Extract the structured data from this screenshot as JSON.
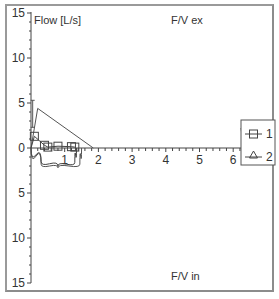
{
  "chart_data": {
    "type": "line",
    "title_top": "F/V ex",
    "title_bottom": "F/V in",
    "ylabel": "Flow [L/s]",
    "xlabel": "",
    "xlim": [
      0,
      6.8
    ],
    "ylim_top": [
      0,
      15
    ],
    "ylim_bottom": [
      0,
      15
    ],
    "x_ticks": [
      "1",
      "2",
      "3",
      "4",
      "5",
      "6"
    ],
    "y_ticks_top": [
      "15",
      "10",
      "5",
      "0"
    ],
    "y_ticks_bottom": [
      "5",
      "10",
      "15"
    ],
    "grid": false,
    "legend_position": "right",
    "legend": [
      {
        "label": "1",
        "marker": "square"
      },
      {
        "label": "2",
        "marker": "triangle"
      }
    ],
    "series": [
      {
        "name": "1",
        "marker": "square",
        "description": "measured expiratory/inspiratory flow-volume loop",
        "expiratory_points": [
          [
            0.1,
            1.3
          ],
          [
            0.4,
            0.3
          ],
          [
            0.5,
            0.1
          ],
          [
            0.8,
            0.2
          ],
          [
            1.2,
            0.15
          ],
          [
            1.3,
            0.1
          ]
        ],
        "inspiratory_points": [
          [
            0.0,
            0.0
          ],
          [
            0.3,
            -1.5
          ],
          [
            0.8,
            -2.0
          ],
          [
            1.3,
            -1.6
          ],
          [
            1.35,
            0.0
          ]
        ]
      },
      {
        "name": "2",
        "marker": "triangle",
        "description": "predicted flow-volume curve",
        "expiratory_points": [
          [
            0.0,
            0.0
          ],
          [
            0.2,
            4.4
          ],
          [
            1.85,
            0.0
          ]
        ],
        "inspiratory_points": [
          [
            0.0,
            0.0
          ],
          [
            0.3,
            -1.8
          ],
          [
            0.8,
            -2.2
          ],
          [
            1.45,
            -1.8
          ],
          [
            1.5,
            0.0
          ]
        ]
      }
    ],
    "annotations": [
      {
        "type": "predicted-range-bar",
        "x": 0.05,
        "y_range": [
          2.3,
          5.3
        ]
      }
    ]
  }
}
